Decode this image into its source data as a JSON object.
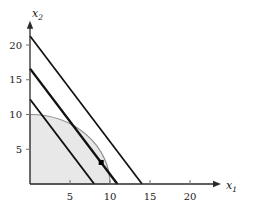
{
  "figure": {
    "name": "linear-objective-over-quarter-disc-feasible-region",
    "background": "#ffffff",
    "axes": {
      "x": {
        "label": "x",
        "subscript": "1",
        "ticks": [
          5,
          10,
          15,
          20
        ],
        "tick_labels": [
          "5",
          "10",
          "15",
          "20"
        ],
        "range": [
          0,
          23
        ],
        "arrow": true
      },
      "y": {
        "label": "x",
        "subscript": "2",
        "ticks": [
          5,
          10,
          15,
          20
        ],
        "tick_labels": [
          "5",
          "10",
          "15",
          "20"
        ],
        "range": [
          0,
          22.5
        ],
        "arrow": true
      },
      "axis_color": "#2b2b2b",
      "tick_color": "#6e6e6e",
      "grid": false
    }
  },
  "chart_data": {
    "type": "line",
    "title": "",
    "xlabel": "x_1",
    "ylabel": "x_2",
    "xlim": [
      0,
      23
    ],
    "ylim": [
      0,
      22.5
    ],
    "xticks": [
      5,
      10,
      15,
      20
    ],
    "yticks": [
      5,
      10,
      15,
      20
    ],
    "grid": false,
    "legend": "none",
    "series": [
      {
        "name": "objective-line-lower",
        "kind": "line",
        "color": "#111111",
        "width": 1.9,
        "points": [
          [
            0,
            12.2
          ],
          [
            8.03,
            0
          ]
        ],
        "y_intercept": 12.2,
        "x_intercept": 8.03,
        "slope": -1.52
      },
      {
        "name": "objective-line-optimal",
        "kind": "line",
        "color": "#111111",
        "width": 2.4,
        "points": [
          [
            0,
            16.6
          ],
          [
            10.92,
            0
          ]
        ],
        "y_intercept": 16.6,
        "x_intercept": 10.92,
        "slope": -1.52,
        "tangent": true
      },
      {
        "name": "objective-line-upper",
        "kind": "line",
        "color": "#111111",
        "width": 1.7,
        "points": [
          [
            0,
            21.3
          ],
          [
            14.01,
            0
          ]
        ],
        "y_intercept": 21.3,
        "x_intercept": 14.01,
        "slope": -1.52
      },
      {
        "name": "feasible-region-boundary-arc",
        "kind": "arc",
        "color": "#8c8c8c",
        "width": 1.2,
        "radius": 10,
        "center": [
          0,
          0
        ],
        "from": [
          0,
          10
        ],
        "to": [
          10,
          0
        ]
      },
      {
        "name": "feasible-region-fill",
        "kind": "area",
        "fill": "#e8e8e8",
        "stroke": "#b5b5b5",
        "description": "quarter disc of radius 10 in the first quadrant"
      }
    ],
    "points": [
      {
        "name": "optimal-point",
        "x": 8.9,
        "y": 3.1,
        "marker": "square",
        "color": "#000000",
        "size": 5
      }
    ]
  }
}
